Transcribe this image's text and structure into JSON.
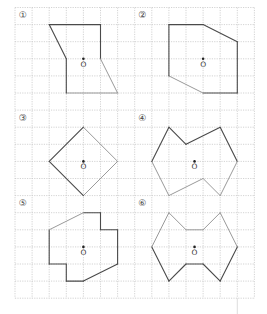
{
  "diagram": {
    "grid": {
      "origin_x": 15,
      "origin_y": 7.5,
      "cell": 17.1,
      "cols": 14,
      "rows": 17,
      "line_color": "#c8c8c8",
      "tail_line": {
        "col": 13,
        "from_row": 17,
        "to_y": 314
      }
    },
    "colors": {
      "dark_edge": "#4a4a4a",
      "light_edge": "#9a9a9a"
    },
    "center_label_text": "O",
    "figures": [
      {
        "id": 1,
        "label": "①",
        "label_pos": [
          0.45,
          0.45
        ],
        "center": [
          4,
          3
        ],
        "vertices": [
          [
            2,
            1
          ],
          [
            5,
            1
          ],
          [
            5,
            3
          ],
          [
            6,
            5
          ],
          [
            3,
            5
          ],
          [
            3,
            3
          ]
        ],
        "edge_styles": [
          "dark",
          "dark",
          "light",
          "light",
          "dark",
          "dark"
        ]
      },
      {
        "id": 2,
        "label": "②",
        "label_pos": [
          7.45,
          0.45
        ],
        "center": [
          11,
          3
        ],
        "vertices": [
          [
            9,
            1
          ],
          [
            11,
            1
          ],
          [
            13,
            2
          ],
          [
            13,
            5
          ],
          [
            11,
            5
          ],
          [
            9,
            4
          ]
        ],
        "edge_styles": [
          "dark",
          "dark",
          "dark",
          "dark",
          "light",
          "dark"
        ]
      },
      {
        "id": 3,
        "label": "③",
        "label_pos": [
          0.45,
          6.45
        ],
        "center": [
          4,
          9
        ],
        "vertices": [
          [
            4,
            7
          ],
          [
            6,
            9
          ],
          [
            4,
            11
          ],
          [
            2,
            9
          ]
        ],
        "edge_styles": [
          "light",
          "light",
          "dark",
          "dark"
        ]
      },
      {
        "id": 4,
        "label": "④",
        "label_pos": [
          7.45,
          6.45
        ],
        "center": [
          10.5,
          9
        ],
        "vertices": [
          [
            9,
            7
          ],
          [
            10,
            8
          ],
          [
            12,
            7
          ],
          [
            13,
            9
          ],
          [
            12,
            11
          ],
          [
            11,
            10
          ],
          [
            9,
            11
          ],
          [
            8,
            9
          ]
        ],
        "edge_styles": [
          "dark",
          "dark",
          "dark",
          "light",
          "light",
          "light",
          "light",
          "dark"
        ]
      },
      {
        "id": 5,
        "label": "⑤",
        "label_pos": [
          0.45,
          11.45
        ],
        "center": [
          4,
          14
        ],
        "vertices": [
          [
            4,
            12
          ],
          [
            5,
            12
          ],
          [
            5,
            13
          ],
          [
            6,
            13
          ],
          [
            6,
            15
          ],
          [
            4,
            16
          ],
          [
            3,
            16
          ],
          [
            3,
            15
          ],
          [
            2,
            15
          ],
          [
            2,
            13
          ]
        ],
        "edge_styles": [
          "dark",
          "dark",
          "dark",
          "dark",
          "dark",
          "dark",
          "dark",
          "dark",
          "dark",
          "light"
        ]
      },
      {
        "id": 6,
        "label": "⑥",
        "label_pos": [
          7.45,
          11.45
        ],
        "center": [
          10.5,
          14
        ],
        "vertices": [
          [
            9,
            12
          ],
          [
            10,
            13
          ],
          [
            11,
            13
          ],
          [
            12,
            12
          ],
          [
            13,
            14
          ],
          [
            12,
            16
          ],
          [
            11,
            15
          ],
          [
            10,
            15
          ],
          [
            9,
            16
          ],
          [
            8,
            14
          ]
        ],
        "edge_styles": [
          "light",
          "light",
          "light",
          "light",
          "dark",
          "dark",
          "dark",
          "dark",
          "dark",
          "light"
        ]
      }
    ]
  }
}
